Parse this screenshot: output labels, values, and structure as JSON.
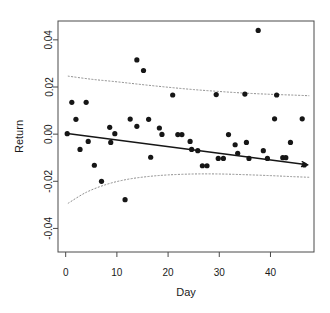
{
  "chart_data": {
    "type": "scatter",
    "title": "",
    "xlabel": "Day",
    "ylabel": "Return",
    "xlim": [
      -1.5,
      48.5
    ],
    "ylim": [
      -0.05,
      0.048
    ],
    "grid": false,
    "legend": null,
    "x_ticks": [
      0,
      10,
      20,
      30,
      40
    ],
    "x_tick_labels": [
      "0",
      "10",
      "20",
      "30",
      "40"
    ],
    "y_ticks": [
      0.04,
      0.02,
      0.0,
      -0.02,
      -0.04
    ],
    "y_tick_labels": [
      "0.04",
      "0.02",
      "0.00",
      "-0.02",
      "-0.04"
    ],
    "points": [
      {
        "x": 0.3,
        "y": 0.0002
      },
      {
        "x": 1.2,
        "y": 0.0135
      },
      {
        "x": 2.0,
        "y": 0.0063
      },
      {
        "x": 2.8,
        "y": -0.0065
      },
      {
        "x": 4.0,
        "y": 0.0135
      },
      {
        "x": 4.4,
        "y": -0.0031
      },
      {
        "x": 5.6,
        "y": -0.0132
      },
      {
        "x": 7.0,
        "y": -0.02
      },
      {
        "x": 8.6,
        "y": 0.0029
      },
      {
        "x": 8.8,
        "y": -0.0035
      },
      {
        "x": 9.6,
        "y": 0.0002
      },
      {
        "x": 11.6,
        "y": -0.0278
      },
      {
        "x": 12.6,
        "y": 0.0064
      },
      {
        "x": 13.9,
        "y": 0.0315
      },
      {
        "x": 13.9,
        "y": 0.0033
      },
      {
        "x": 15.2,
        "y": 0.027
      },
      {
        "x": 16.2,
        "y": 0.0063
      },
      {
        "x": 16.6,
        "y": -0.0098
      },
      {
        "x": 18.3,
        "y": 0.0026
      },
      {
        "x": 18.8,
        "y": -0.0001
      },
      {
        "x": 20.9,
        "y": 0.0166
      },
      {
        "x": 21.9,
        "y": -0.0002
      },
      {
        "x": 22.7,
        "y": -0.0002
      },
      {
        "x": 24.3,
        "y": -0.0031
      },
      {
        "x": 24.6,
        "y": -0.0065
      },
      {
        "x": 25.8,
        "y": -0.007
      },
      {
        "x": 26.7,
        "y": -0.0134
      },
      {
        "x": 27.6,
        "y": -0.0134
      },
      {
        "x": 29.4,
        "y": 0.0168
      },
      {
        "x": 29.8,
        "y": -0.0103
      },
      {
        "x": 30.8,
        "y": -0.0103
      },
      {
        "x": 31.8,
        "y": -0.0002
      },
      {
        "x": 33.1,
        "y": -0.0045
      },
      {
        "x": 33.6,
        "y": -0.0081
      },
      {
        "x": 35.0,
        "y": 0.017
      },
      {
        "x": 35.3,
        "y": -0.0035
      },
      {
        "x": 35.8,
        "y": -0.0103
      },
      {
        "x": 37.6,
        "y": 0.044
      },
      {
        "x": 38.6,
        "y": -0.007
      },
      {
        "x": 39.4,
        "y": -0.0103
      },
      {
        "x": 40.8,
        "y": 0.0065
      },
      {
        "x": 41.2,
        "y": 0.0166
      },
      {
        "x": 42.4,
        "y": -0.01
      },
      {
        "x": 43.0,
        "y": -0.01
      },
      {
        "x": 43.9,
        "y": -0.0035
      },
      {
        "x": 46.2,
        "y": 0.0065
      },
      {
        "x": 46.6,
        "y": -0.0131
      }
    ],
    "fit_line": {
      "name": "regression-line",
      "x_start": 0.3,
      "y_start": 0.0003,
      "x_end": 47.2,
      "y_end": -0.013,
      "arrow_end": true
    },
    "confidence_bands": [
      {
        "name": "upper-confidence-band",
        "points": [
          {
            "x": 0.5,
            "y": 0.0246
          },
          {
            "x": 5.0,
            "y": 0.0233
          },
          {
            "x": 10.0,
            "y": 0.0222
          },
          {
            "x": 15.0,
            "y": 0.021
          },
          {
            "x": 20.0,
            "y": 0.0199
          },
          {
            "x": 25.0,
            "y": 0.0189
          },
          {
            "x": 30.0,
            "y": 0.0181
          },
          {
            "x": 35.0,
            "y": 0.0174
          },
          {
            "x": 40.0,
            "y": 0.0169
          },
          {
            "x": 44.0,
            "y": 0.0166
          },
          {
            "x": 47.5,
            "y": 0.0163
          }
        ]
      },
      {
        "name": "lower-confidence-band",
        "points": [
          {
            "x": 0.5,
            "y": -0.0293
          },
          {
            "x": 4.0,
            "y": -0.0247
          },
          {
            "x": 8.0,
            "y": -0.0213
          },
          {
            "x": 12.0,
            "y": -0.0192
          },
          {
            "x": 16.0,
            "y": -0.018
          },
          {
            "x": 20.0,
            "y": -0.0173
          },
          {
            "x": 25.0,
            "y": -0.0169
          },
          {
            "x": 30.0,
            "y": -0.0169
          },
          {
            "x": 35.0,
            "y": -0.0172
          },
          {
            "x": 40.0,
            "y": -0.0176
          },
          {
            "x": 44.0,
            "y": -0.018
          },
          {
            "x": 47.5,
            "y": -0.0183
          }
        ]
      }
    ]
  },
  "figure": {
    "background_color": "#ffffff",
    "point_color": "#161616",
    "line_color": "#161616",
    "band_color": "#8d8d8d",
    "axis_color": "#4a4a4a"
  }
}
